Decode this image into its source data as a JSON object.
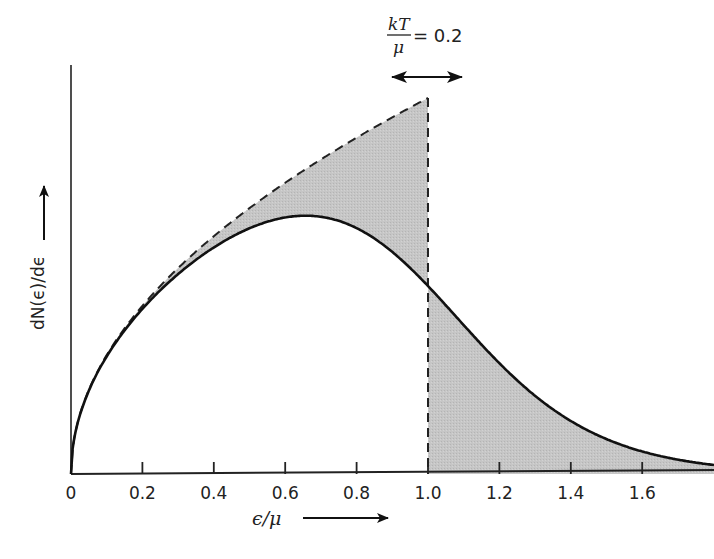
{
  "chart_data": {
    "type": "area",
    "title": "",
    "xlabel": "ϵ/μ",
    "ylabel": "dN(ϵ)/dϵ",
    "xlim": [
      0,
      1.8
    ],
    "x_ticks": [
      "0",
      "0.2",
      "0.4",
      "0.6",
      "0.8",
      "1.0",
      "1.2",
      "1.4",
      "1.6"
    ],
    "x_tick_values": [
      0,
      0.2,
      0.4,
      0.6,
      0.8,
      1.0,
      1.2,
      1.4,
      1.6
    ],
    "grid": false,
    "annotation": {
      "numerator": "kT",
      "denominator": "μ",
      "equals": "= 0.2",
      "kT_over_mu": 0.2
    },
    "series": [
      {
        "name": "T = 0 density of occupied states (dashed)",
        "style": "dashed",
        "description": "proportional to sqrt(ϵ/μ), cut off at ϵ/μ = 1",
        "x": [
          0,
          0.1,
          0.2,
          0.3,
          0.4,
          0.5,
          0.6,
          0.7,
          0.8,
          0.9,
          1.0
        ],
        "values": [
          0,
          0.316,
          0.447,
          0.548,
          0.632,
          0.707,
          0.775,
          0.837,
          0.894,
          0.949,
          1.0
        ]
      },
      {
        "name": "Finite temperature occupied states (solid)",
        "style": "solid",
        "description": "sqrt(ϵ/μ) × Fermi-Dirac occupancy at kT/μ = 0.2",
        "x": [
          0,
          0.1,
          0.2,
          0.3,
          0.4,
          0.5,
          0.6,
          0.7,
          0.8,
          0.9,
          1.0,
          1.1,
          1.2,
          1.3,
          1.4,
          1.5,
          1.6,
          1.7,
          1.8
        ],
        "values": [
          0,
          0.313,
          0.439,
          0.531,
          0.6,
          0.651,
          0.68,
          0.683,
          0.654,
          0.589,
          0.5,
          0.398,
          0.295,
          0.207,
          0.139,
          0.091,
          0.058,
          0.036,
          0.02
        ]
      }
    ],
    "shading": "grey fill between dashed and solid curves for ϵ/μ < 1, and under solid curve for ϵ/μ > 1",
    "colors": {
      "line": "#111111",
      "fill": "#c4c4c4",
      "background": "#ffffff"
    }
  }
}
